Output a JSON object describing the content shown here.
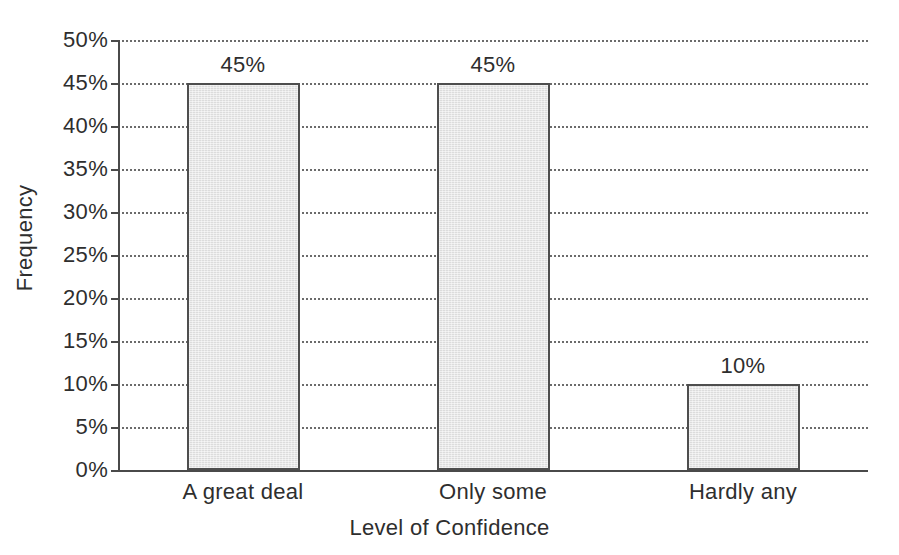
{
  "chart_data": {
    "type": "bar",
    "title": "",
    "subtitle": "",
    "categories": [
      "A great deal",
      "Only some",
      "Hardly any"
    ],
    "values": [
      45,
      45,
      10
    ],
    "value_labels": [
      "45%",
      "45%",
      "10%"
    ],
    "xlabel": "Level of Confidence",
    "ylabel": "Frequency",
    "ylim": [
      0,
      50
    ],
    "ytick_values": [
      0,
      5,
      10,
      15,
      20,
      25,
      30,
      35,
      40,
      45,
      50
    ],
    "ytick_labels": [
      "0%",
      "5%",
      "10%",
      "15%",
      "20%",
      "25%",
      "30%",
      "35%",
      "40%",
      "45%",
      "50%"
    ],
    "grid": true,
    "grid_axis": "y",
    "grid_style": "dotted",
    "legend": false,
    "legend_position": "none",
    "bar_fill_color": "#dcdcdc",
    "bar_border_color": "#4e4e4e",
    "axis_color": "#4a4a4a",
    "text_color": "#2e2e2e",
    "background_color": "#ffffff"
  }
}
